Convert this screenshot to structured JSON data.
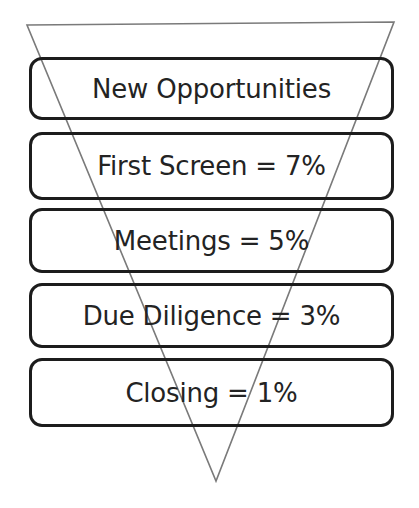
{
  "canvas": {
    "width": 419,
    "height": 508,
    "background": "#ffffff"
  },
  "diagram": {
    "type": "funnel",
    "title": "",
    "outline_color": "#7a7a7a",
    "box_border_color": "#1c1c1c",
    "text_color": "#232323",
    "stages": [
      {
        "label": "New Opportunities",
        "name": "new-opportunities",
        "percent": null,
        "percent_text": ""
      },
      {
        "label": "First Screen = 7%",
        "name": "first-screen",
        "percent": 7,
        "percent_text": "7%"
      },
      {
        "label": "Meetings = 5%",
        "name": "meetings",
        "percent": 5,
        "percent_text": "5%"
      },
      {
        "label": "Due Diligence = 3%",
        "name": "due-diligence",
        "percent": 3,
        "percent_text": "3%"
      },
      {
        "label": "Closing = 1%",
        "name": "closing",
        "percent": 1,
        "percent_text": "1%"
      }
    ]
  },
  "chart_data": {
    "type": "funnel",
    "title": "",
    "subtitle": "",
    "xlabel": "",
    "ylabel": "",
    "categories": [
      "New Opportunities",
      "First Screen",
      "Meetings",
      "Due Diligence",
      "Closing"
    ],
    "values": [
      100,
      7,
      5,
      3,
      1
    ],
    "value_labels": [
      "",
      "7%",
      "5%",
      "3%",
      "1%"
    ],
    "unit": "%",
    "annotations": [
      "New Opportunities",
      "First Screen = 7%",
      "Meetings = 5%",
      "Due Diligence = 3%",
      "Closing = 1%"
    ],
    "legend": [],
    "grid": false
  },
  "funnel_geometry": {
    "top_left": [
      27,
      25
    ],
    "top_right": [
      394,
      22
    ],
    "apex": [
      216,
      481
    ],
    "stroke_width": 1.6
  }
}
